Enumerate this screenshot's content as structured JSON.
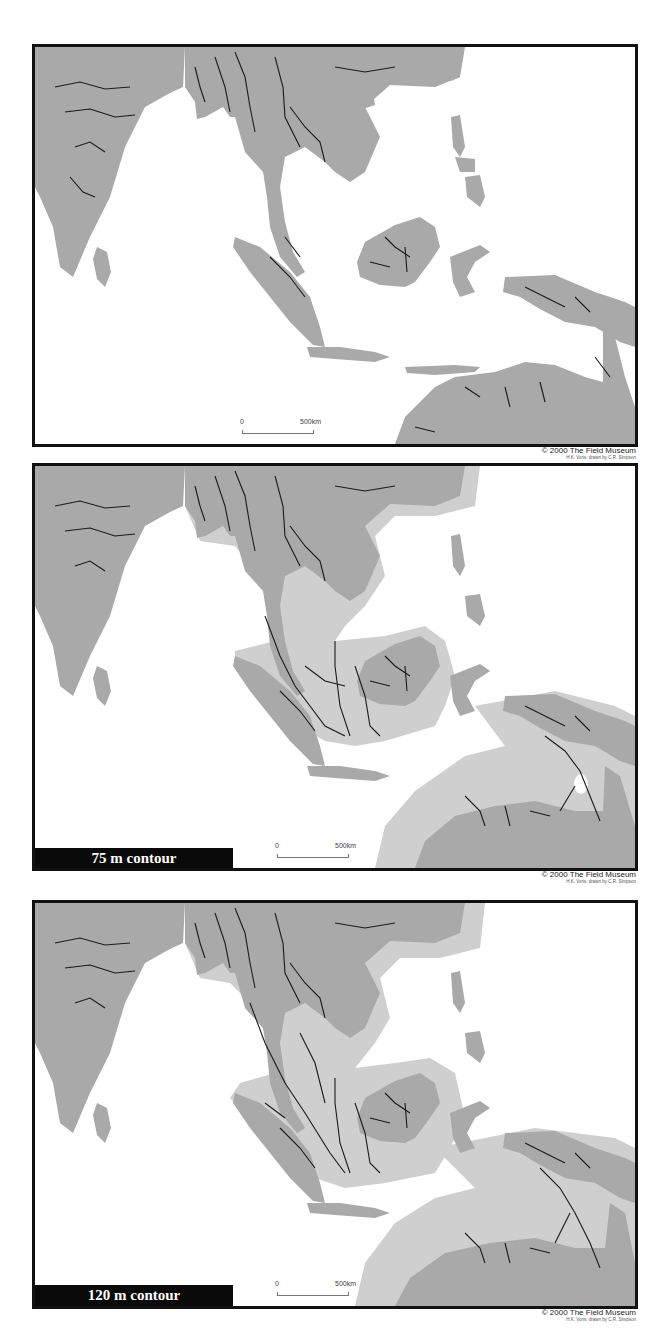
{
  "figure": {
    "panels": [
      {
        "id": "present",
        "label": "",
        "scale": {
          "zero": "0",
          "distance": "500km"
        },
        "credit": {
          "line1": "© 2000 The Field Museum",
          "line2": "H.K. Voris; drawn by C.R. Simpson"
        }
      },
      {
        "id": "75m",
        "label": "75 m contour",
        "scale": {
          "zero": "0",
          "distance": "500km"
        },
        "credit": {
          "line1": "© 2000 The Field Museum",
          "line2": "H.K. Voris; drawn by C.R. Simpson"
        }
      },
      {
        "id": "120m",
        "label": "120 m contour",
        "scale": {
          "zero": "0",
          "distance": "500km"
        },
        "credit": {
          "line1": "© 2000 The Field Museum",
          "line2": "H.K. Voris; drawn by C.R. Simpson"
        }
      }
    ],
    "colors": {
      "land": "#a9a9a9",
      "exposed_shelf": "#cfcfcf",
      "rivers": "#1a1a1a",
      "sea": "#ffffff",
      "frame": "#111111"
    },
    "regions": [
      "India",
      "Sri Lanka",
      "Indochina",
      "Malay Peninsula",
      "Sumatra",
      "Borneo",
      "Java",
      "Sulawesi",
      "Philippines",
      "New Guinea",
      "Australia"
    ]
  }
}
